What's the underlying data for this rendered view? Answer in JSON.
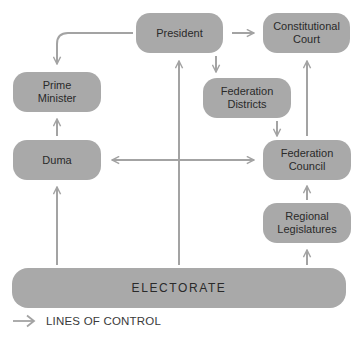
{
  "diagram": {
    "nodes": {
      "president": "President",
      "constitutional_court": "Constitutional\nCourt",
      "prime_minister": "Prime\nMinister",
      "federation_districts": "Federation\nDistricts",
      "duma": "Duma",
      "federation_council": "Federation\nCouncil",
      "regional_legislatures": "Regional\nLegislatures",
      "electorate": "ELECTORATE"
    },
    "edges": [
      {
        "from": "President",
        "to": "Constitutional Court"
      },
      {
        "from": "President",
        "to": "Prime Minister"
      },
      {
        "from": "President",
        "to": "Federation Districts"
      },
      {
        "from": "Federation Districts",
        "to": "Federation Council"
      },
      {
        "from": "Federation Council",
        "to": "Constitutional Court"
      },
      {
        "from": "Duma",
        "to": "Prime Minister"
      },
      {
        "from": "Duma",
        "to": "Federation Council",
        "bidirectional": true
      },
      {
        "from": "Electorate",
        "to": "Duma"
      },
      {
        "from": "Electorate",
        "to": "President"
      },
      {
        "from": "Electorate",
        "to": "Regional Legislatures"
      },
      {
        "from": "Regional Legislatures",
        "to": "Federation Council"
      }
    ],
    "legend": {
      "label": "LINES OF CONTROL"
    },
    "colors": {
      "box": "#a9a9a9",
      "line": "#a3a3a3",
      "text": "#2a2a2a"
    }
  }
}
